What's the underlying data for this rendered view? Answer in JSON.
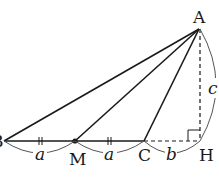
{
  "figure": {
    "points": {
      "A": {
        "label": "A",
        "x": 199,
        "y": 29
      },
      "B": {
        "label": "B",
        "x": 4,
        "y": 141
      },
      "M": {
        "label": "M",
        "x": 75,
        "y": 141
      },
      "C": {
        "label": "C",
        "x": 144,
        "y": 141
      },
      "H": {
        "label": "H",
        "x": 200,
        "y": 141
      }
    },
    "segments": [
      {
        "from": "A",
        "to": "B",
        "style": "solid"
      },
      {
        "from": "A",
        "to": "M",
        "style": "solid"
      },
      {
        "from": "A",
        "to": "C",
        "style": "solid"
      },
      {
        "from": "B",
        "to": "C",
        "style": "solid"
      },
      {
        "from": "C",
        "to": "H",
        "style": "dashed"
      },
      {
        "from": "A",
        "to": "H",
        "style": "dashed"
      }
    ],
    "lengths": {
      "BM": "a",
      "MC": "a",
      "CH": "b",
      "AH": "c"
    },
    "marks": {
      "equal_ticks": [
        "BM",
        "MC"
      ],
      "right_angle_at": "H"
    },
    "colors": {
      "line": "#1a1a1a",
      "brace": "#555555"
    }
  }
}
